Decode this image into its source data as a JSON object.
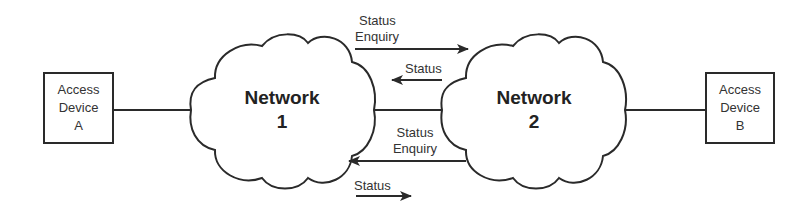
{
  "devices": {
    "a": {
      "line1": "Access",
      "line2": "Device",
      "line3": "A"
    },
    "b": {
      "line1": "Access",
      "line2": "Device",
      "line3": "B"
    }
  },
  "networks": {
    "n1": {
      "line1": "Network",
      "line2": "1"
    },
    "n2": {
      "line1": "Network",
      "line2": "2"
    }
  },
  "messages": {
    "top_enquiry": {
      "line1": "Status",
      "line2": "Enquiry",
      "direction": "right"
    },
    "top_status": {
      "label": "Status",
      "direction": "left"
    },
    "bottom_enquiry": {
      "line1": "Status",
      "line2": "Enquiry",
      "direction": "left"
    },
    "bottom_status": {
      "label": "Status",
      "direction": "right"
    }
  },
  "colors": {
    "stroke": "#2a2a2a",
    "background": "#ffffff",
    "text": "#333333"
  }
}
